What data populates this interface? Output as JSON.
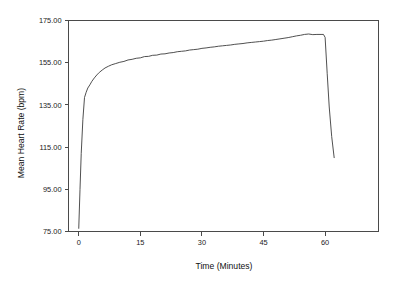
{
  "chart_data": {
    "type": "line",
    "title": "",
    "subtitle": "",
    "xlabel": "Time (Minutes)",
    "ylabel": "Mean Heart Rate (bpm)",
    "xlim": [
      -2.5,
      73
    ],
    "ylim": [
      75,
      175
    ],
    "xticks": [
      0,
      15,
      30,
      45,
      60
    ],
    "xtick_labels": [
      "0",
      "15",
      "30",
      "45",
      "60"
    ],
    "yticks": [
      75,
      95,
      115,
      135,
      155,
      175
    ],
    "ytick_labels": [
      "75.00",
      "95.00",
      "115.00",
      "135.00",
      "155.00",
      "175.00"
    ],
    "grid": false,
    "legend": null,
    "legend_position": "none",
    "line_color": "#3c3c3c",
    "frame_color": "#4a4a4a",
    "series": [
      {
        "name": "Mean Heart Rate",
        "x": [
          0.0,
          0.3,
          0.6,
          1.0,
          1.4,
          1.8,
          2.2,
          2.7,
          3.2,
          3.8,
          4.4,
          5.0,
          5.7,
          6.4,
          7.2,
          8.0,
          9.0,
          10.0,
          11.0,
          12.0,
          13.0,
          14.0,
          15.0,
          16.0,
          17.0,
          18.0,
          19.0,
          20.0,
          21.0,
          22.0,
          23.0,
          24.0,
          25.0,
          26.0,
          27.0,
          28.0,
          29.0,
          30.0,
          31.0,
          32.0,
          33.0,
          34.0,
          35.0,
          36.0,
          37.0,
          38.0,
          39.0,
          40.0,
          41.0,
          42.0,
          43.0,
          44.0,
          45.0,
          46.0,
          47.0,
          48.0,
          49.0,
          50.0,
          51.0,
          52.0,
          53.0,
          54.0,
          55.0,
          56.0,
          57.0,
          58.0,
          59.0,
          59.6,
          60.0,
          60.5,
          61.0,
          61.6,
          62.2
        ],
        "y": [
          76.5,
          95.0,
          112.0,
          128.0,
          138.5,
          141.0,
          143.0,
          144.5,
          146.2,
          147.8,
          149.2,
          150.4,
          151.5,
          152.5,
          153.3,
          154.0,
          154.6,
          155.2,
          155.6,
          156.3,
          156.6,
          157.1,
          157.3,
          157.9,
          158.0,
          158.5,
          158.6,
          159.1,
          159.2,
          159.6,
          159.8,
          160.2,
          160.4,
          160.6,
          161.0,
          161.2,
          161.4,
          161.8,
          162.0,
          162.3,
          162.5,
          162.8,
          163.0,
          163.2,
          163.4,
          163.7,
          163.9,
          164.1,
          164.4,
          164.6,
          164.8,
          165.0,
          165.2,
          165.5,
          165.7,
          166.0,
          166.3,
          166.6,
          166.9,
          167.3,
          167.7,
          168.0,
          168.4,
          168.6,
          168.3,
          168.4,
          168.4,
          168.4,
          167.0,
          150.0,
          134.0,
          120.0,
          110.0
        ]
      }
    ]
  },
  "axes": {
    "x_axis_title": "Time (Minutes)",
    "y_axis_title": "Mean Heart Rate (bpm)"
  }
}
